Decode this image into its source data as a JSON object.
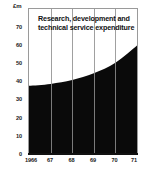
{
  "chart_data": {
    "type": "area",
    "title": "Research, development and technical service expenditure",
    "xlabel": "",
    "ylabel": "£m",
    "unit_caption": "£m",
    "categories": [
      "1966",
      "67",
      "68",
      "69",
      "70",
      "71"
    ],
    "values": [
      35,
      36,
      38,
      41.5,
      47,
      56
    ],
    "series": [
      {
        "name": "Research, development and technical service expenditure",
        "values": [
          35,
          36,
          38,
          41.5,
          47,
          56
        ]
      }
    ],
    "ylim": [
      0,
      75
    ],
    "xlim": [
      "1966",
      "71"
    ],
    "y_ticks": [
      70,
      60,
      50,
      40,
      30,
      20,
      10,
      0
    ],
    "y_tick_labels": [
      "70",
      "60",
      "50",
      "40",
      "30",
      "20",
      "10",
      "0"
    ],
    "x_tick_labels": [
      "1966",
      "67",
      "68",
      "69",
      "70",
      "71"
    ],
    "grid": "vertical-only",
    "legend": "none",
    "area_color": "#0a0a0a",
    "gridline_color": "#8f8f8f",
    "frame_color": "#9a9a9a",
    "background_color": "#ffffff",
    "text_color": "#1a1a1a"
  }
}
